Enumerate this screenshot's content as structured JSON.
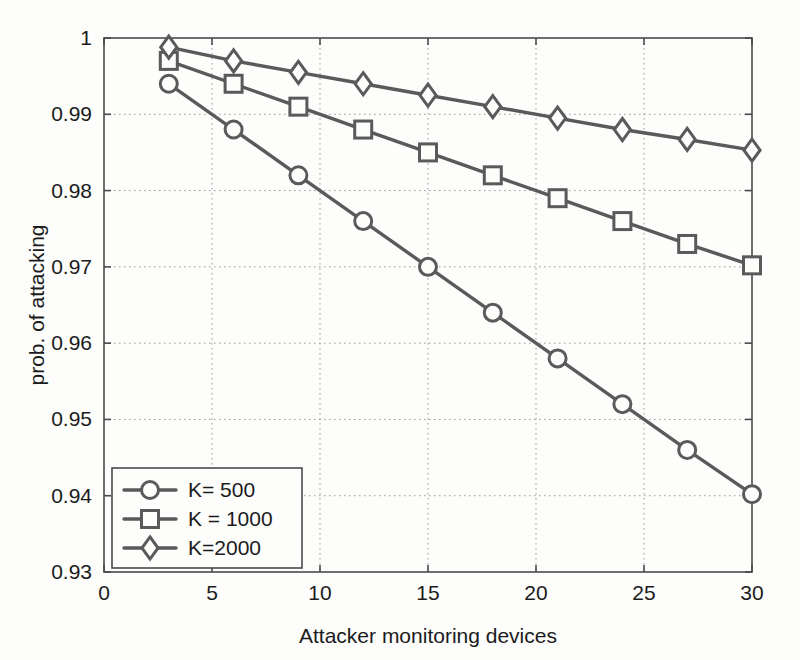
{
  "figure": {
    "background_color": "#fdfdfc",
    "line_color": "#5a5a5a",
    "axis_color": "#4a4a4a",
    "grid_color": "#9b9b9b"
  },
  "axes": {
    "xlabel": "Attacker monitoring devices",
    "ylabel": "prob. of attacking",
    "xticks": [
      "0",
      "5",
      "10",
      "15",
      "20",
      "25",
      "30"
    ],
    "yticks": [
      "0.93",
      "0.94",
      "0.95",
      "0.96",
      "0.97",
      "0.98",
      "0.99",
      "1"
    ]
  },
  "legend": {
    "entries": [
      {
        "label": "K= 500",
        "marker": "circle-marker"
      },
      {
        "label": "K = 1000",
        "marker": "square-marker"
      },
      {
        "label": "K=2000",
        "marker": "diamond-marker"
      }
    ]
  },
  "chart_data": {
    "type": "line",
    "title": "",
    "xlabel": "Attacker monitoring devices",
    "ylabel": "prob. of attacking",
    "xlim": [
      0,
      30
    ],
    "ylim": [
      0.93,
      1.0
    ],
    "xticks": [
      0,
      5,
      10,
      15,
      20,
      25,
      30
    ],
    "yticks": [
      0.93,
      0.94,
      0.95,
      0.96,
      0.97,
      0.98,
      0.99,
      1.0
    ],
    "grid": true,
    "legend_position": "lower left",
    "x": [
      3,
      6,
      9,
      12,
      15,
      18,
      21,
      24,
      27,
      30
    ],
    "series": [
      {
        "name": "K= 500",
        "marker": "circle",
        "values": [
          0.994,
          0.988,
          0.982,
          0.976,
          0.97,
          0.964,
          0.958,
          0.952,
          0.946,
          0.9402
        ]
      },
      {
        "name": "K = 1000",
        "marker": "square",
        "values": [
          0.997,
          0.994,
          0.991,
          0.988,
          0.985,
          0.982,
          0.979,
          0.976,
          0.973,
          0.9702
        ]
      },
      {
        "name": "K=2000",
        "marker": "diamond",
        "values": [
          0.9988,
          0.997,
          0.9955,
          0.994,
          0.9925,
          0.991,
          0.9895,
          0.988,
          0.9867,
          0.9853
        ]
      }
    ]
  }
}
